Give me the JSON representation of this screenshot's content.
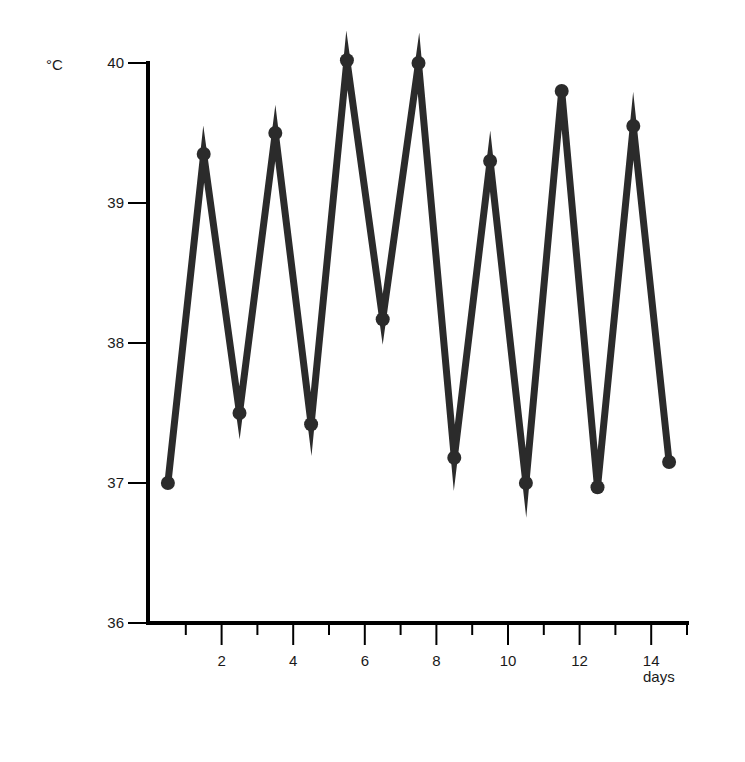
{
  "chart_data": {
    "type": "line",
    "title": "",
    "xlabel": "days",
    "ylabel": "°C",
    "xlim": [
      0,
      15
    ],
    "ylim": [
      36,
      40
    ],
    "x_ticks_major": [
      2,
      4,
      6,
      8,
      10,
      12,
      14
    ],
    "x_ticks_minor": [
      1,
      3,
      5,
      7,
      9,
      11,
      13,
      15
    ],
    "y_ticks": [
      36,
      37,
      38,
      39,
      40
    ],
    "grid": false,
    "legend": null,
    "series": [
      {
        "name": "temperature",
        "color": "#2b2b2b",
        "marker": "circle",
        "x": [
          0.5,
          1.5,
          2.5,
          3.5,
          4.5,
          5.5,
          6.5,
          7.5,
          8.5,
          9.5,
          10.5,
          11.5,
          12.5,
          13.5,
          14.5
        ],
        "values": [
          37.0,
          39.35,
          37.5,
          39.5,
          37.42,
          40.02,
          38.17,
          40.0,
          37.18,
          39.3,
          37.0,
          39.8,
          36.97,
          39.55,
          37.15
        ]
      }
    ]
  },
  "labels": {
    "y_unit": "°C",
    "x_unit": "days"
  }
}
